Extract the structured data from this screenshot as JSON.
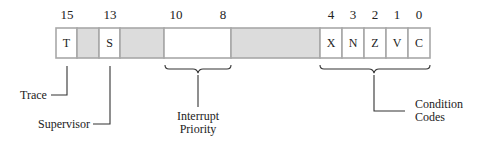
{
  "diagram": {
    "bit_numbers": [
      {
        "label": "15",
        "x": 67
      },
      {
        "label": "13",
        "x": 110
      },
      {
        "label": "10",
        "x": 176
      },
      {
        "label": "8",
        "x": 223
      },
      {
        "label": "4",
        "x": 331
      },
      {
        "label": "3",
        "x": 353
      },
      {
        "label": "2",
        "x": 375
      },
      {
        "label": "1",
        "x": 397
      },
      {
        "label": "0",
        "x": 419
      }
    ],
    "cells": [
      {
        "id": "trace-bit",
        "text": "T",
        "x": 56,
        "w": 21,
        "shaded": false
      },
      {
        "id": "unused-bit-14",
        "text": "",
        "x": 77,
        "w": 22,
        "shaded": true
      },
      {
        "id": "supervisor-bit",
        "text": "S",
        "x": 99,
        "w": 21,
        "shaded": false
      },
      {
        "id": "unused-bits-12-11",
        "text": "",
        "x": 120,
        "w": 44,
        "shaded": true
      },
      {
        "id": "interrupt-priority-bits",
        "text": "",
        "x": 164,
        "w": 67,
        "shaded": false
      },
      {
        "id": "unused-bits-7-5",
        "text": "",
        "x": 231,
        "w": 89,
        "shaded": true
      },
      {
        "id": "extend-bit",
        "text": "X",
        "x": 320,
        "w": 22,
        "shaded": false
      },
      {
        "id": "negative-bit",
        "text": "N",
        "x": 342,
        "w": 22,
        "shaded": false
      },
      {
        "id": "zero-bit",
        "text": "Z",
        "x": 364,
        "w": 22,
        "shaded": false
      },
      {
        "id": "overflow-bit",
        "text": "V",
        "x": 386,
        "w": 22,
        "shaded": false
      },
      {
        "id": "carry-bit",
        "text": "C",
        "x": 408,
        "w": 22,
        "shaded": false
      }
    ],
    "labels": {
      "trace": "Trace",
      "supervisor": "Supervisor",
      "interrupt_line1": "Interrupt",
      "interrupt_line2": "Priority",
      "condition_line1": "Condition",
      "condition_line2": "Codes"
    },
    "colors": {
      "shaded_cell": "#dcdcdc",
      "cell_border": "#a8a8a8",
      "line": "#333333"
    }
  }
}
